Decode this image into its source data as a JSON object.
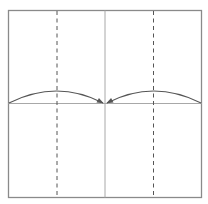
{
  "diagram": {
    "title": "Origami step: fold both sides to the center",
    "type": "origami-fold-diagram",
    "paper": {
      "shape": "square",
      "border_color": "#8a8a8a",
      "fill_color": "#ffffff"
    },
    "lines": [
      {
        "id": "center-vertical-crease",
        "kind": "existing-crease",
        "orientation": "vertical",
        "position_fraction": 0.5,
        "style": "solid",
        "color": "#a8a8a8"
      },
      {
        "id": "center-horizontal-crease",
        "kind": "existing-crease",
        "orientation": "horizontal",
        "position_fraction": 0.5,
        "style": "solid",
        "color": "#a8a8a8"
      },
      {
        "id": "left-valley-fold",
        "kind": "valley-fold",
        "orientation": "vertical",
        "position_fraction": 0.25,
        "style": "dashed",
        "color": "#555555"
      },
      {
        "id": "right-valley-fold",
        "kind": "valley-fold",
        "orientation": "vertical",
        "position_fraction": 0.75,
        "style": "dashed",
        "color": "#555555"
      }
    ],
    "arrows": [
      {
        "id": "left-fold-arrow",
        "from": "left-edge",
        "to": "center",
        "meaning": "fold left edge to center line",
        "color": "#555555"
      },
      {
        "id": "right-fold-arrow",
        "from": "right-edge",
        "to": "center",
        "meaning": "fold right edge to center line",
        "color": "#555555"
      }
    ]
  }
}
